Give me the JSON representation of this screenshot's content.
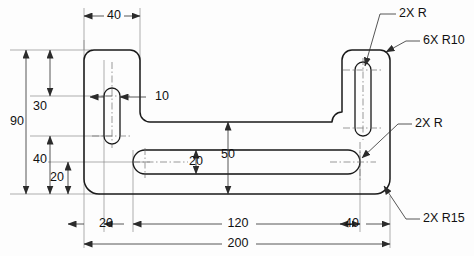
{
  "drawing": {
    "title": "Bracket Plate Orthographic View",
    "view": "front-view",
    "units": "mm",
    "colors": {
      "outline": "#1a1a1a",
      "dimension": "#2b2b2b",
      "extension": "#8a8a8a",
      "centerline": "#6e6e6e",
      "background": "#fdfdfd"
    },
    "linear_dimensions": [
      {
        "id": "top-width-40",
        "label": "40",
        "orientation": "horizontal",
        "x": 112,
        "y": 16
      },
      {
        "id": "slot-width-10",
        "label": "10",
        "orientation": "horizontal",
        "x": 155,
        "y": 97
      },
      {
        "id": "height-overall-90",
        "label": "90",
        "orientation": "vertical",
        "x": 17,
        "y": 122
      },
      {
        "id": "height-30",
        "label": "30",
        "orientation": "vertical",
        "x": 40,
        "y": 107
      },
      {
        "id": "height-40",
        "label": "40",
        "orientation": "vertical",
        "x": 40,
        "y": 160
      },
      {
        "id": "height-20",
        "label": "20",
        "orientation": "vertical",
        "x": 57,
        "y": 178
      },
      {
        "id": "slot-height-20",
        "label": "20",
        "orientation": "vertical",
        "x": 196,
        "y": 162
      },
      {
        "id": "web-height-50",
        "label": "50",
        "orientation": "vertical",
        "x": 228,
        "y": 155
      },
      {
        "id": "bottom-left-20",
        "label": "20",
        "orientation": "horizontal",
        "x": 106,
        "y": 224
      },
      {
        "id": "bottom-mid-120",
        "label": "120",
        "orientation": "horizontal",
        "x": 238,
        "y": 224
      },
      {
        "id": "bottom-right-40",
        "label": "40",
        "orientation": "horizontal",
        "x": 352,
        "y": 224
      },
      {
        "id": "bottom-overall-200",
        "label": "200",
        "orientation": "horizontal",
        "x": 238,
        "y": 244
      }
    ],
    "radius_notes": [
      {
        "id": "note-slot-radius-top",
        "label": "2X R",
        "x": 400,
        "y": 18
      },
      {
        "id": "note-corner-radius-r10",
        "label": "6X R10",
        "x": 424,
        "y": 45
      },
      {
        "id": "note-slot-radius-mid",
        "label": "2X R",
        "x": 416,
        "y": 127
      },
      {
        "id": "note-corner-radius-r15",
        "label": "2X R15",
        "x": 424,
        "y": 222
      }
    ]
  }
}
